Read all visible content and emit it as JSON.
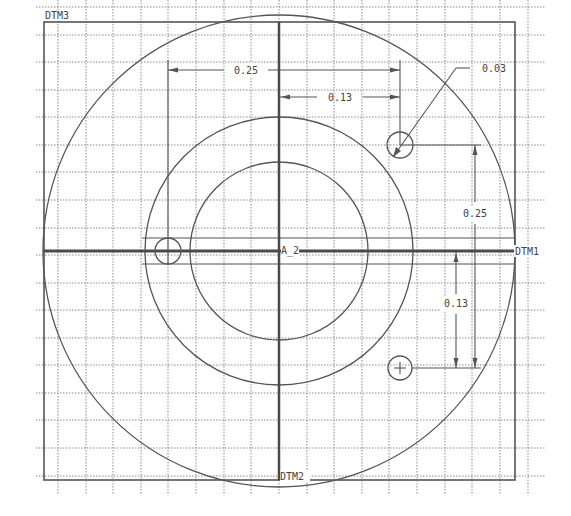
{
  "drawing": {
    "type": "CAD 2D sketch",
    "datums": {
      "frame_label": "DTM3",
      "horizontal_axis_label": "DTM1",
      "vertical_axis_label": "DTM2",
      "axis_intersection_label": "A_2"
    },
    "dimensions": [
      {
        "id": "horizontal-0.25",
        "value": "0.25",
        "orientation": "horizontal"
      },
      {
        "id": "horizontal-0.13",
        "value": "0.13",
        "orientation": "horizontal"
      },
      {
        "id": "hole-diameter-0.03",
        "value": "0.03",
        "orientation": "leader"
      },
      {
        "id": "vertical-0.25",
        "value": "0.25",
        "orientation": "vertical"
      },
      {
        "id": "vertical-0.13",
        "value": "0.13",
        "orientation": "vertical"
      }
    ],
    "features": {
      "concentric_circles": 3,
      "holes": 3
    },
    "colors": {
      "background": "#ffffff",
      "line": "#555555",
      "grid": "#8a8a8a",
      "text": "#444444"
    }
  },
  "labels": {
    "dtm3": "DTM3",
    "dtm1": "DTM1",
    "dtm2": "DTM2",
    "a2": "A_2",
    "dim_h_025": "0.25",
    "dim_h_013": "0.13",
    "dim_dia_003": "0.03",
    "dim_v_025": "0.25",
    "dim_v_013": "0.13"
  }
}
